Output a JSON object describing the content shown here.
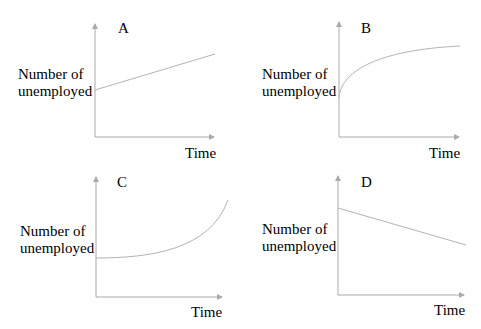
{
  "colors": {
    "axis": "#aaaaaa",
    "curve": "#b3b3b3",
    "text": "#222222"
  },
  "panels": [
    {
      "letter": "A",
      "ylabel_line1": "Number of",
      "ylabel_line2": "unemployed",
      "xlabel": "Time",
      "shape": "linear increasing"
    },
    {
      "letter": "B",
      "ylabel_line1": "Number of",
      "ylabel_line2": "unemployed",
      "xlabel": "Time",
      "shape": "concave increasing (decelerating growth)"
    },
    {
      "letter": "C",
      "ylabel_line1": "Number of",
      "ylabel_line2": "unemployed",
      "xlabel": "Time",
      "shape": "convex increasing (accelerating growth)"
    },
    {
      "letter": "D",
      "ylabel_line1": "Number of",
      "ylabel_line2": "unemployed",
      "xlabel": "Time",
      "shape": "linear decreasing"
    }
  ]
}
